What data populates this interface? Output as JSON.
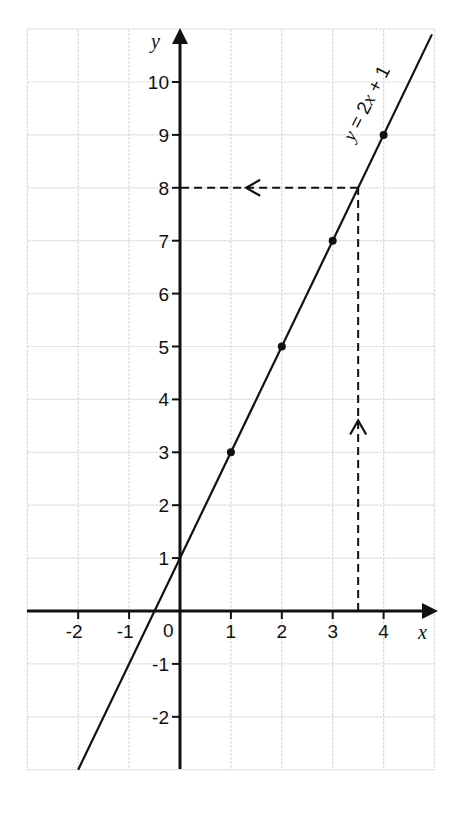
{
  "chart_data": {
    "type": "line",
    "title": "",
    "xlabel": "x",
    "ylabel": "y",
    "xlim": [
      -3,
      5
    ],
    "ylim": [
      -3,
      11
    ],
    "grid": true,
    "x_ticks": [
      -2,
      -1,
      0,
      1,
      2,
      3,
      4
    ],
    "y_ticks": [
      -2,
      -1,
      1,
      2,
      3,
      4,
      5,
      6,
      7,
      8,
      9,
      10
    ],
    "origin_label": "0",
    "series": [
      {
        "name": "y = 2x + 1",
        "equation": "y = 2x + 1",
        "slope": 2,
        "intercept": 1,
        "line_from": [
          -2,
          -3
        ],
        "line_to": [
          4.95,
          10.9
        ],
        "points": [
          {
            "x": 1,
            "y": 3
          },
          {
            "x": 2,
            "y": 5
          },
          {
            "x": 3,
            "y": 7
          },
          {
            "x": 4,
            "y": 9
          }
        ]
      }
    ],
    "annotations": [
      {
        "type": "dashed-arrow",
        "description": "vertical dashed line from x-axis at x = 3.5 up to the line, arrow pointing up",
        "from": [
          3.5,
          0
        ],
        "to": [
          3.5,
          8
        ],
        "arrow_at": [
          3.5,
          3.6
        ],
        "direction": "up"
      },
      {
        "type": "dashed-arrow",
        "description": "horizontal dashed line from the line at y = 8 to the y-axis, arrow pointing left",
        "from": [
          3.5,
          8
        ],
        "to": [
          0,
          8
        ],
        "arrow_at": [
          1.3,
          8
        ],
        "direction": "left"
      }
    ],
    "equation_label": {
      "prefix_italic": "y",
      "mid": " = 2",
      "var_italic": "x",
      "suffix": " + 1"
    }
  },
  "colors": {
    "grid": "#dcdcdc",
    "axis": "#111111",
    "line": "#111111",
    "background": "#ffffff"
  }
}
